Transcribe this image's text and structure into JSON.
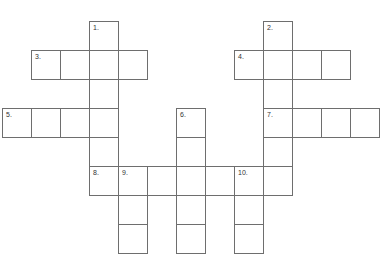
{
  "puzzle": {
    "type": "crossword",
    "cell_size": 29,
    "origin": {
      "x": 2,
      "y": 21
    },
    "cells": [
      {
        "c": 3,
        "r": 0,
        "num": "1."
      },
      {
        "c": 9,
        "r": 0,
        "num": "2."
      },
      {
        "c": 1,
        "r": 1,
        "num": "3."
      },
      {
        "c": 2,
        "r": 1
      },
      {
        "c": 3,
        "r": 1
      },
      {
        "c": 4,
        "r": 1
      },
      {
        "c": 8,
        "r": 1,
        "num": "4."
      },
      {
        "c": 9,
        "r": 1
      },
      {
        "c": 10,
        "r": 1
      },
      {
        "c": 11,
        "r": 1
      },
      {
        "c": 3,
        "r": 2
      },
      {
        "c": 9,
        "r": 2
      },
      {
        "c": 0,
        "r": 3,
        "num": "5."
      },
      {
        "c": 1,
        "r": 3
      },
      {
        "c": 2,
        "r": 3
      },
      {
        "c": 3,
        "r": 3
      },
      {
        "c": 6,
        "r": 3,
        "num": "6."
      },
      {
        "c": 9,
        "r": 3,
        "num": "7."
      },
      {
        "c": 10,
        "r": 3
      },
      {
        "c": 11,
        "r": 3
      },
      {
        "c": 12,
        "r": 3
      },
      {
        "c": 3,
        "r": 4
      },
      {
        "c": 6,
        "r": 4
      },
      {
        "c": 9,
        "r": 4
      },
      {
        "c": 3,
        "r": 5,
        "num": "8."
      },
      {
        "c": 4,
        "r": 5,
        "num": "9."
      },
      {
        "c": 5,
        "r": 5
      },
      {
        "c": 6,
        "r": 5
      },
      {
        "c": 7,
        "r": 5
      },
      {
        "c": 8,
        "r": 5,
        "num": "10."
      },
      {
        "c": 9,
        "r": 5
      },
      {
        "c": 4,
        "r": 6
      },
      {
        "c": 6,
        "r": 6
      },
      {
        "c": 8,
        "r": 6
      },
      {
        "c": 4,
        "r": 7
      },
      {
        "c": 6,
        "r": 7
      },
      {
        "c": 8,
        "r": 7
      }
    ]
  }
}
